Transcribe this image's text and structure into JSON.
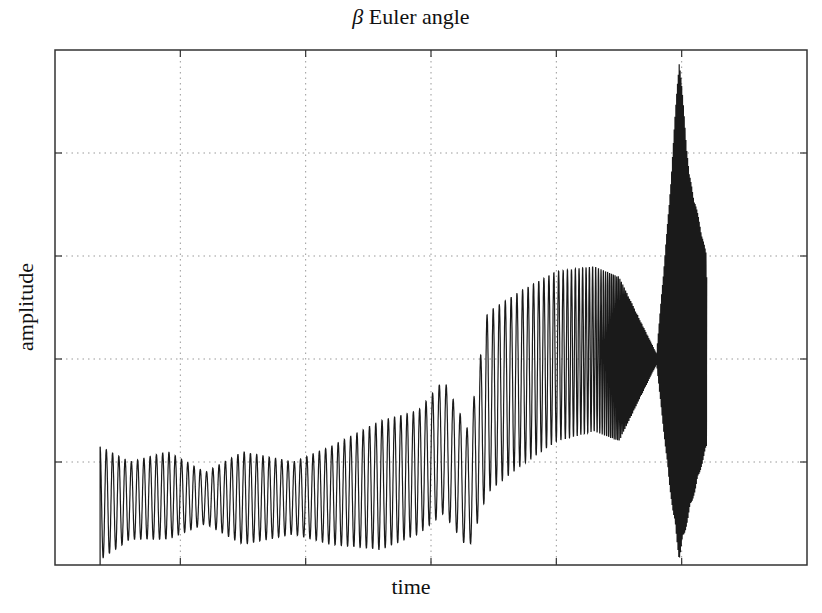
{
  "chart_data": {
    "type": "line",
    "title": "β Euler angle",
    "title_symbol": "β",
    "title_text": "Euler angle",
    "xlabel": "time",
    "ylabel": "amplitude",
    "x_tick_labels": [],
    "y_tick_labels": [],
    "xlim": [
      0,
      6
    ],
    "ylim": [
      0,
      5
    ],
    "x_ticks": [
      1,
      2,
      3,
      4,
      5
    ],
    "y_ticks": [
      1,
      2,
      3,
      4
    ],
    "grid": true,
    "grid_style": "dotted",
    "legend": null,
    "line_color": "#1a1a1a",
    "series": [
      {
        "name": "beta",
        "description": "Oscillating signal; envelope estimated (axis units, no numeric labels shown)",
        "envelope": [
          {
            "x": 0.36,
            "upper": 1.15,
            "lower": 0.05,
            "cycles_per_unit": 20
          },
          {
            "x": 0.6,
            "upper": 1.0,
            "lower": 0.25,
            "cycles_per_unit": 20
          },
          {
            "x": 0.9,
            "upper": 1.1,
            "lower": 0.25,
            "cycles_per_unit": 20
          },
          {
            "x": 1.2,
            "upper": 0.9,
            "lower": 0.4,
            "cycles_per_unit": 20
          },
          {
            "x": 1.5,
            "upper": 1.1,
            "lower": 0.2,
            "cycles_per_unit": 20
          },
          {
            "x": 1.9,
            "upper": 1.0,
            "lower": 0.3,
            "cycles_per_unit": 20
          },
          {
            "x": 2.2,
            "upper": 1.15,
            "lower": 0.2,
            "cycles_per_unit": 20
          },
          {
            "x": 2.6,
            "upper": 1.4,
            "lower": 0.15,
            "cycles_per_unit": 20
          },
          {
            "x": 2.9,
            "upper": 1.5,
            "lower": 0.3,
            "cycles_per_unit": 20
          },
          {
            "x": 3.1,
            "upper": 1.8,
            "lower": 0.5,
            "cycles_per_unit": 18
          },
          {
            "x": 3.3,
            "upper": 1.3,
            "lower": 0.15,
            "cycles_per_unit": 18
          },
          {
            "x": 3.45,
            "upper": 2.45,
            "lower": 0.7,
            "cycles_per_unit": 20
          },
          {
            "x": 3.7,
            "upper": 2.65,
            "lower": 0.95,
            "cycles_per_unit": 22
          },
          {
            "x": 4.0,
            "upper": 2.85,
            "lower": 1.2,
            "cycles_per_unit": 26
          },
          {
            "x": 4.3,
            "upper": 2.9,
            "lower": 1.3,
            "cycles_per_unit": 40
          },
          {
            "x": 4.5,
            "upper": 2.8,
            "lower": 1.2,
            "cycles_per_unit": 80
          },
          {
            "x": 4.8,
            "upper": 2.05,
            "lower": 1.95,
            "cycles_per_unit": 150
          },
          {
            "x": 4.9,
            "upper": 3.5,
            "lower": 0.8,
            "cycles_per_unit": 150
          },
          {
            "x": 4.98,
            "upper": 4.95,
            "lower": 0.05,
            "cycles_per_unit": 150
          },
          {
            "x": 5.06,
            "upper": 3.8,
            "lower": 0.5,
            "cycles_per_unit": 150
          },
          {
            "x": 5.2,
            "upper": 3.0,
            "lower": 1.15,
            "cycles_per_unit": 150
          }
        ]
      }
    ]
  }
}
